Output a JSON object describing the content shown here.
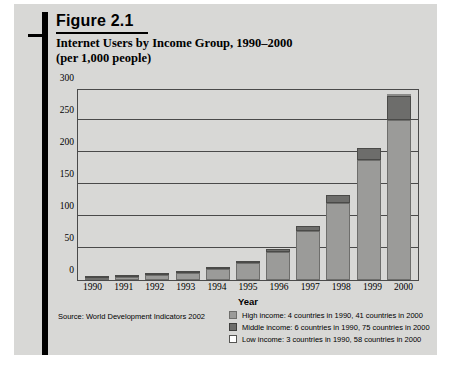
{
  "figure": {
    "label": "Figure 2.1",
    "title_line1": "Internet Users by Income Group, 1990–2000",
    "title_line2": "(per 1,000 people)",
    "source": "Source: World Development Indicators 2002"
  },
  "legend": {
    "position": "below-right",
    "entries": [
      {
        "swatch": "high-income-swatch",
        "color": "#9b9b99",
        "label": "High income: 4 countries in 1990, 41 countries in 2000"
      },
      {
        "swatch": "middle-income-swatch",
        "color": "#6d6d6b",
        "label": "Middle income: 6 countries in 1990, 75 countries in 2000"
      },
      {
        "swatch": "low-income-swatch",
        "color": "#ffffff",
        "label": "Low income: 3 countries in 1990, 58 countries in 2000"
      }
    ]
  },
  "chart_data": {
    "type": "bar",
    "stacked": true,
    "title": "Internet Users by Income Group, 1990–2000 (per 1,000 people)",
    "xlabel": "Year",
    "ylabel": "",
    "ylim": [
      0,
      300
    ],
    "yticks": [
      0,
      50,
      100,
      150,
      200,
      250,
      300
    ],
    "ytick_labels": [
      "0",
      "50",
      "100",
      "150",
      "200",
      "250",
      "300"
    ],
    "grid": true,
    "grid_axis": "y",
    "categories": [
      "1990",
      "1991",
      "1992",
      "1993",
      "1994",
      "1995",
      "1996",
      "1997",
      "1998",
      "1999",
      "2000"
    ],
    "series": [
      {
        "name": "High income: 4 countries in 1990, 41 countries in 2000",
        "color": "#9b9b99",
        "values": [
          3,
          5,
          8,
          11,
          17,
          27,
          44,
          76,
          120,
          187,
          250
        ]
      },
      {
        "name": "Middle income: 6 countries in 1990, 75 countries in 2000",
        "color": "#6d6d6b",
        "values": [
          1,
          1,
          1,
          2,
          2,
          3,
          4,
          9,
          13,
          20,
          38
        ]
      },
      {
        "name": "Low income: 3 countries in 1990, 58 countries in 2000",
        "color": "#ffffff",
        "values": [
          0,
          0,
          0,
          0,
          0,
          0,
          0,
          0,
          0,
          0,
          3
        ]
      }
    ],
    "totals": [
      4,
      6,
      9,
      13,
      19,
      30,
      48,
      85,
      133,
      207,
      291
    ]
  }
}
